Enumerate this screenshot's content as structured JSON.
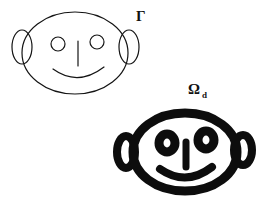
{
  "figure": {
    "width": 268,
    "height": 206,
    "background_color": "#ffffff",
    "ink_color": "#111111",
    "labels": [
      {
        "id": "gamma",
        "text": "Γ",
        "subscript": "",
        "x": 136,
        "y": 9,
        "font_size": 15,
        "bold": true
      },
      {
        "id": "omega-d",
        "text": "Ω",
        "subscript": "d",
        "x": 188,
        "y": 82,
        "font_size": 15,
        "bold": true
      }
    ],
    "shapes": {
      "face_thin": {
        "name": "thin-outline-face",
        "stroke_width": 1.1,
        "fill": "none",
        "head": {
          "cx": 75,
          "cy": 53,
          "rx": 53,
          "ry": 41
        },
        "ear_left": {
          "cx": 22,
          "cy": 47,
          "rx": 10,
          "ry": 17
        },
        "ear_right": {
          "cx": 129,
          "cy": 47,
          "rx": 10,
          "ry": 17
        },
        "eye_left": {
          "cx": 58,
          "cy": 44,
          "r": 7
        },
        "eye_right": {
          "cx": 97,
          "cy": 42,
          "r": 7
        },
        "nose": {
          "x": 78,
          "y1": 41,
          "y2": 66
        },
        "mouth": {
          "x1": 53,
          "y1": 70,
          "cx": 78,
          "cy": 84,
          "x2": 104,
          "y2": 68
        }
      },
      "face_thick": {
        "name": "thick-dilated-face",
        "stroke_width": 9,
        "fill": "none",
        "head": {
          "cx": 185,
          "cy": 152,
          "rx": 52,
          "ry": 39
        },
        "ear_left": {
          "cx": 126,
          "cy": 152,
          "rx": 9,
          "ry": 16
        },
        "ear_right": {
          "cx": 243,
          "cy": 150,
          "rx": 9,
          "ry": 15
        },
        "eye_left": {
          "cx": 167,
          "cy": 143,
          "r": 8
        },
        "eye_right": {
          "cx": 206,
          "cy": 140,
          "r": 8
        },
        "nose": {
          "x": 186,
          "y1": 141,
          "y2": 168
        },
        "mouth": {
          "x1": 160,
          "y1": 170,
          "cx": 186,
          "cy": 184,
          "x2": 212,
          "y2": 168
        }
      }
    }
  }
}
